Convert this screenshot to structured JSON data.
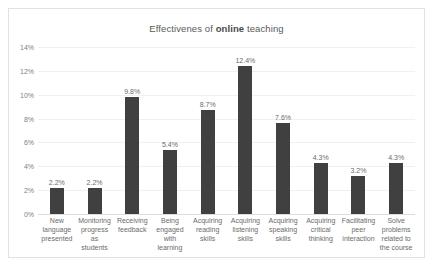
{
  "chart_data": {
    "type": "bar",
    "title": "Effectivenes of online teaching",
    "title_prefix": "Effectivenes of ",
    "title_bold": "online",
    "title_suffix": " teaching",
    "xlabel": "",
    "ylabel": "",
    "ylim": [
      0,
      14
    ],
    "ytick_labels": [
      "14%",
      "12%",
      "10%",
      "8%",
      "6%",
      "4%",
      "2%",
      "0%"
    ],
    "ytick_values": [
      14,
      12,
      10,
      8,
      6,
      4,
      2,
      0
    ],
    "grid": true,
    "grid_axis": "y",
    "legend": false,
    "bar_color": "#404040",
    "categories": [
      "New language presented",
      "Monitoring progress as students",
      "Receiving feedback",
      "Being engaged with learning",
      "Acquiring reading skills",
      "Acquiring listening skills",
      "Acquiring speaking skills",
      "Acquiring critical thinking",
      "Facilitating peer interaction",
      "Solve problems related to the course"
    ],
    "values": [
      2.2,
      2.2,
      9.8,
      5.4,
      8.7,
      12.4,
      7.6,
      4.3,
      3.2,
      4.3
    ],
    "data_labels": [
      "2.2%",
      "2.2%",
      "9.8%",
      "5.4%",
      "8.7%",
      "12.4%",
      "7.6%",
      "4.3%",
      "3.2%",
      "4.3%"
    ]
  }
}
